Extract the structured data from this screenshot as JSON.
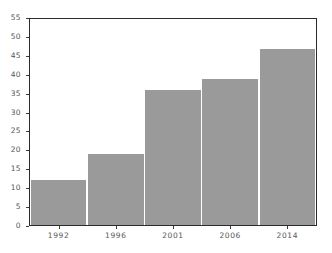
{
  "chart_data": {
    "type": "bar",
    "title": "",
    "subtitle": "",
    "xlabel": "",
    "ylabel": "",
    "categories": [
      "1992",
      "1996",
      "2001",
      "2006",
      "2014"
    ],
    "values": [
      12,
      19,
      36,
      39,
      47
    ],
    "series": [
      {
        "name": "",
        "values": [
          12,
          19,
          36,
          39,
          47
        ]
      }
    ],
    "ylim": [
      0,
      55
    ],
    "ytick_labels": [
      "55",
      "50",
      "45",
      "40",
      "35",
      "30",
      "25",
      "20",
      "15",
      "10",
      "5",
      "0"
    ],
    "ytick_values": [
      55,
      50,
      45,
      40,
      35,
      30,
      25,
      20,
      15,
      10,
      5,
      0
    ],
    "ytick_step": 5,
    "grid": false,
    "legend": false,
    "legend_position": "none",
    "bar_color": "#9a9a9a",
    "frame_color": "#2b2b2b",
    "tick_color": "#3a3a3a",
    "label_color": "#555555",
    "background_color": "#ffffff",
    "annotations": []
  }
}
